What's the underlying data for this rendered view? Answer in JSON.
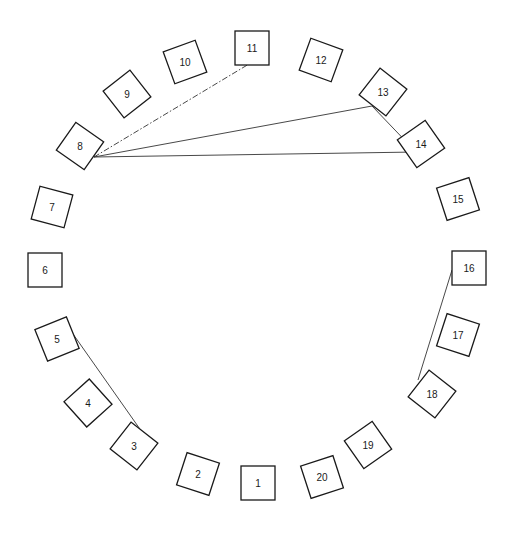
{
  "diagram": {
    "type": "circular-seating-sociogram",
    "box_size": 34,
    "stroke_color": "#1a1a1a",
    "line_color": "#333333",
    "nodes": [
      {
        "label": "1",
        "x": 258,
        "y": 483,
        "rot": 0
      },
      {
        "label": "2",
        "x": 198,
        "y": 474,
        "rot": 18
      },
      {
        "label": "3",
        "x": 134,
        "y": 446,
        "rot": 38
      },
      {
        "label": "4",
        "x": 88,
        "y": 403,
        "rot": 48
      },
      {
        "label": "5",
        "x": 57,
        "y": 339,
        "rot": -22
      },
      {
        "label": "6",
        "x": 45,
        "y": 270,
        "rot": 0
      },
      {
        "label": "7",
        "x": 52,
        "y": 207,
        "rot": 15
      },
      {
        "label": "8",
        "x": 80,
        "y": 146,
        "rot": 35
      },
      {
        "label": "9",
        "x": 127,
        "y": 94,
        "rot": 52
      },
      {
        "label": "10",
        "x": 185,
        "y": 62,
        "rot": -20
      },
      {
        "label": "11",
        "x": 252,
        "y": 48,
        "rot": 0
      },
      {
        "label": "12",
        "x": 321,
        "y": 60,
        "rot": 20
      },
      {
        "label": "13",
        "x": 383,
        "y": 92,
        "rot": 38
      },
      {
        "label": "14",
        "x": 421,
        "y": 144,
        "rot": -35
      },
      {
        "label": "15",
        "x": 458,
        "y": 199,
        "rot": -18
      },
      {
        "label": "16",
        "x": 469,
        "y": 268,
        "rot": 0
      },
      {
        "label": "17",
        "x": 458,
        "y": 335,
        "rot": 18
      },
      {
        "label": "18",
        "x": 432,
        "y": 394,
        "rot": 38
      },
      {
        "label": "19",
        "x": 368,
        "y": 445,
        "rot": -35
      },
      {
        "label": "20",
        "x": 322,
        "y": 477,
        "rot": -18
      }
    ],
    "edges": [
      {
        "from": "8",
        "to": "11",
        "style": "dash-dot",
        "x1": 94,
        "y1": 157,
        "x2": 249,
        "y2": 64
      },
      {
        "from": "8",
        "to": "13",
        "style": "solid",
        "x1": 94,
        "y1": 157,
        "x2": 372,
        "y2": 106
      },
      {
        "from": "8",
        "to": "14",
        "style": "solid",
        "x1": 94,
        "y1": 157,
        "x2": 416,
        "y2": 152
      },
      {
        "from": "13",
        "to": "14",
        "style": "solid",
        "x1": 372,
        "y1": 106,
        "x2": 416,
        "y2": 152
      },
      {
        "from": "5",
        "to": "3",
        "style": "solid",
        "x1": 73,
        "y1": 334,
        "x2": 142,
        "y2": 432
      },
      {
        "from": "16",
        "to": "18",
        "style": "solid",
        "x1": 452,
        "y1": 270,
        "x2": 418,
        "y2": 380
      }
    ]
  }
}
